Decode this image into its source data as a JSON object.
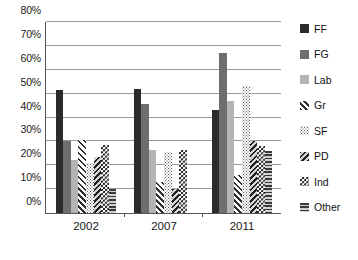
{
  "chart_data": {
    "type": "bar",
    "title": "",
    "subtitle": "",
    "xlabel": "",
    "ylabel": "",
    "categories": [
      "2002",
      "2007",
      "2011"
    ],
    "ylim": [
      0,
      80
    ],
    "ytick_labels": [
      "0%",
      "10%",
      "20%",
      "30%",
      "40%",
      "50%",
      "60%",
      "70%",
      "80%"
    ],
    "ytick_values": [
      0,
      10,
      20,
      30,
      40,
      50,
      60,
      70,
      80
    ],
    "ytick_suffix": "%",
    "grid": true,
    "legend_position": "right",
    "series": [
      {
        "name": "FF",
        "color": "#2b2b2b",
        "values": [
          51.5,
          52.0,
          43.0
        ]
      },
      {
        "name": "FG",
        "color": "#6e6e6e",
        "values": [
          30.0,
          45.5,
          67.0
        ]
      },
      {
        "name": "Lab",
        "color": "#b4b4b4",
        "values": [
          22.0,
          26.5,
          47.0
        ]
      },
      {
        "name": "Gr",
        "color": "#ffffff",
        "values": [
          30.5,
          13.0,
          16.0
        ]
      },
      {
        "name": "SF",
        "color": "#ffffff",
        "values": [
          21.0,
          25.5,
          53.0
        ]
      },
      {
        "name": "PD",
        "color": "#8e8e8e",
        "values": [
          23.5,
          10.0,
          30.0
        ]
      },
      {
        "name": "Ind",
        "color": "#ffffff",
        "values": [
          28.5,
          26.5,
          28.0
        ]
      },
      {
        "name": "Other",
        "color": "#ffffff",
        "values": [
          10.0,
          0.0,
          26.0
        ]
      }
    ]
  },
  "legend": {
    "items": [
      {
        "label": "FF"
      },
      {
        "label": "FG"
      },
      {
        "label": "Lab"
      },
      {
        "label": "Gr"
      },
      {
        "label": "SF"
      },
      {
        "label": "PD"
      },
      {
        "label": "Ind"
      },
      {
        "label": "Other"
      }
    ]
  }
}
